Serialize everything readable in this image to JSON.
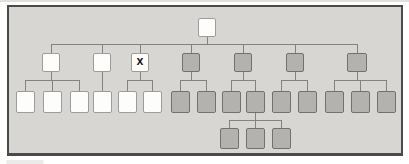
{
  "diagram": {
    "marked_node_label": "X",
    "colors": {
      "page_background": "#ffffff",
      "scan_artifact": "#c6c6c4",
      "panel_fill": "#d7d6d3",
      "panel_border": "#4a4a4a",
      "white_node_fill": "#fdfdfc",
      "white_node_border": "#9c9c9c",
      "gray_node_fill": "#b3b2af",
      "gray_node_border": "#717171",
      "connector": "#828282",
      "mark_text": "#1a1a1a"
    },
    "panel": {
      "x": 7,
      "y": 5,
      "w": 396,
      "h": 151
    },
    "nodes": [
      {
        "id": "root",
        "generation": 1,
        "shade": "white",
        "label": "",
        "cx": 207,
        "top": 18,
        "w": 18,
        "h": 19
      },
      {
        "id": "g2-a",
        "generation": 2,
        "shade": "white",
        "label": "",
        "cx": 51,
        "top": 53,
        "w": 18,
        "h": 19
      },
      {
        "id": "g2-b",
        "generation": 2,
        "shade": "white",
        "label": "",
        "cx": 102,
        "top": 53,
        "w": 18,
        "h": 19
      },
      {
        "id": "g2-c",
        "generation": 2,
        "shade": "white",
        "label": "X",
        "cx": 140,
        "top": 53,
        "w": 18,
        "h": 19
      },
      {
        "id": "g2-d",
        "generation": 2,
        "shade": "gray",
        "label": "",
        "cx": 191,
        "top": 53,
        "w": 18,
        "h": 19
      },
      {
        "id": "g2-e",
        "generation": 2,
        "shade": "gray",
        "label": "",
        "cx": 243,
        "top": 53,
        "w": 18,
        "h": 19
      },
      {
        "id": "g2-f",
        "generation": 2,
        "shade": "gray",
        "label": "",
        "cx": 295,
        "top": 53,
        "w": 18,
        "h": 19
      },
      {
        "id": "g2-g",
        "generation": 2,
        "shade": "gray",
        "label": "",
        "cx": 357,
        "top": 53,
        "w": 20,
        "h": 19
      },
      {
        "id": "g3-a1",
        "generation": 3,
        "shade": "white",
        "label": "",
        "cx": 25,
        "top": 91,
        "w": 19,
        "h": 22
      },
      {
        "id": "g3-a2",
        "generation": 3,
        "shade": "white",
        "label": "",
        "cx": 52,
        "top": 91,
        "w": 19,
        "h": 22
      },
      {
        "id": "g3-a3",
        "generation": 3,
        "shade": "white",
        "label": "",
        "cx": 79,
        "top": 91,
        "w": 19,
        "h": 22
      },
      {
        "id": "g3-b1",
        "generation": 3,
        "shade": "white",
        "label": "",
        "cx": 102,
        "top": 91,
        "w": 19,
        "h": 22
      },
      {
        "id": "g3-c1",
        "generation": 3,
        "shade": "white",
        "label": "",
        "cx": 127,
        "top": 91,
        "w": 19,
        "h": 22
      },
      {
        "id": "g3-c2",
        "generation": 3,
        "shade": "white",
        "label": "",
        "cx": 152,
        "top": 91,
        "w": 19,
        "h": 22
      },
      {
        "id": "g3-d1",
        "generation": 3,
        "shade": "gray",
        "label": "",
        "cx": 180,
        "top": 91,
        "w": 19,
        "h": 22
      },
      {
        "id": "g3-d2",
        "generation": 3,
        "shade": "gray",
        "label": "",
        "cx": 206,
        "top": 91,
        "w": 19,
        "h": 22
      },
      {
        "id": "g3-e1",
        "generation": 3,
        "shade": "gray",
        "label": "",
        "cx": 231,
        "top": 91,
        "w": 19,
        "h": 22
      },
      {
        "id": "g3-e2",
        "generation": 3,
        "shade": "gray",
        "label": "",
        "cx": 255,
        "top": 91,
        "w": 19,
        "h": 22
      },
      {
        "id": "g3-f1",
        "generation": 3,
        "shade": "gray",
        "label": "",
        "cx": 281,
        "top": 91,
        "w": 19,
        "h": 22
      },
      {
        "id": "g3-f2",
        "generation": 3,
        "shade": "gray",
        "label": "",
        "cx": 307,
        "top": 91,
        "w": 19,
        "h": 22
      },
      {
        "id": "g3-g1",
        "generation": 3,
        "shade": "gray",
        "label": "",
        "cx": 334,
        "top": 91,
        "w": 19,
        "h": 22
      },
      {
        "id": "g3-g2",
        "generation": 3,
        "shade": "gray",
        "label": "",
        "cx": 360,
        "top": 91,
        "w": 19,
        "h": 22
      },
      {
        "id": "g3-g3",
        "generation": 3,
        "shade": "gray",
        "label": "",
        "cx": 386,
        "top": 91,
        "w": 19,
        "h": 22
      },
      {
        "id": "g4-1",
        "generation": 4,
        "shade": "gray",
        "label": "",
        "cx": 229,
        "top": 128,
        "w": 19,
        "h": 21
      },
      {
        "id": "g4-2",
        "generation": 4,
        "shade": "gray",
        "label": "",
        "cx": 255,
        "top": 128,
        "w": 19,
        "h": 21
      },
      {
        "id": "g4-3",
        "generation": 4,
        "shade": "gray",
        "label": "",
        "cx": 281,
        "top": 128,
        "w": 19,
        "h": 21
      }
    ],
    "edges": [
      {
        "parent": "root",
        "bus_y": 44,
        "children": [
          "g2-a",
          "g2-b",
          "g2-c",
          "g2-d",
          "g2-e",
          "g2-f",
          "g2-g"
        ]
      },
      {
        "parent": "g2-a",
        "bus_y": 80,
        "children": [
          "g3-a1",
          "g3-a2",
          "g3-a3"
        ]
      },
      {
        "parent": "g2-b",
        "bus_y": 80,
        "children": [
          "g3-b1"
        ]
      },
      {
        "parent": "g2-c",
        "bus_y": 80,
        "children": [
          "g3-c1",
          "g3-c2"
        ]
      },
      {
        "parent": "g2-d",
        "bus_y": 80,
        "children": [
          "g3-d1",
          "g3-d2"
        ]
      },
      {
        "parent": "g2-e",
        "bus_y": 80,
        "children": [
          "g3-e1",
          "g3-e2"
        ]
      },
      {
        "parent": "g2-f",
        "bus_y": 80,
        "children": [
          "g3-f1",
          "g3-f2"
        ]
      },
      {
        "parent": "g2-g",
        "bus_y": 80,
        "children": [
          "g3-g1",
          "g3-g2",
          "g3-g3"
        ]
      },
      {
        "parent": "g3-e2",
        "bus_y": 120,
        "children": [
          "g4-1",
          "g4-2",
          "g4-3"
        ]
      }
    ]
  }
}
